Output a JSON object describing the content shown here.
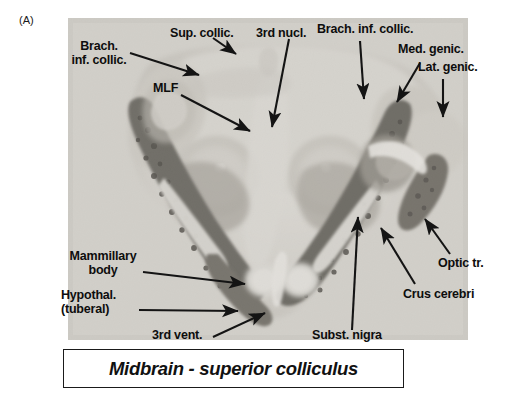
{
  "figure": {
    "panel_letter": "(A)",
    "caption": "Midbrain - superior colliculus",
    "image_kind": "histological-cross-section-photomicrograph",
    "colors": {
      "text": "#0d0d0d",
      "arrow": "#141414",
      "caption_border": "#1a1a1a",
      "photo_background": "#d6d4cf",
      "tissue_light": "#cfcdc7",
      "tissue_mid": "#a9a69f",
      "tissue_dark": "#6e6a63",
      "tissue_darkest": "#3f3c37"
    }
  },
  "labels": [
    {
      "id": "brach-inf-collic-left",
      "line1": "Brach.",
      "line2": "inf. collic."
    },
    {
      "id": "sup-collic",
      "text": "Sup. collic."
    },
    {
      "id": "mlf",
      "text": "MLF"
    },
    {
      "id": "third-nucl",
      "text": "3rd nucl."
    },
    {
      "id": "brach-inf-collic-right",
      "text": "Brach. inf. collic."
    },
    {
      "id": "med-genic",
      "text": "Med. genic."
    },
    {
      "id": "lat-genic",
      "text": "Lat. genic."
    },
    {
      "id": "mammillary-body",
      "line1": "Mammillary",
      "line2": "body"
    },
    {
      "id": "hypothal-tuberal",
      "line1": "Hypothal.",
      "line2": "(tuberal)"
    },
    {
      "id": "third-vent",
      "text": "3rd vent."
    },
    {
      "id": "subst-nigra",
      "text": "Subst. nigra"
    },
    {
      "id": "crus-cerebri",
      "text": "Crus cerebri"
    },
    {
      "id": "optic-tr",
      "text": "Optic tr."
    }
  ]
}
